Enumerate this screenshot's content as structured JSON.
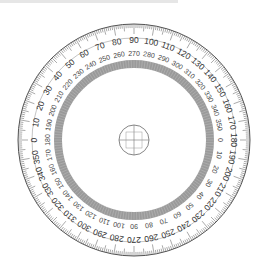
{
  "image": {
    "subject": "360-degree circular protractor",
    "colors": {
      "background": "#ffffff",
      "line": "#555555",
      "inner_band": "#9a9a9a",
      "text": "#333333",
      "top_bar": "#e6e6e6"
    }
  },
  "protractor": {
    "center": [
      134,
      140
    ],
    "outer_radius": 116,
    "outer_scale": {
      "description": "0 at left, increasing clockwise, 90 at top, 180 at right, 270 at bottom",
      "labels": [
        "0",
        "10",
        "20",
        "30",
        "40",
        "50",
        "60",
        "70",
        "80",
        "90",
        "100",
        "110",
        "120",
        "130",
        "140",
        "150",
        "160",
        "170",
        "180",
        "190",
        "200",
        "210",
        "220",
        "230",
        "240",
        "250",
        "260",
        "270",
        "280",
        "290",
        "300",
        "310",
        "320",
        "330",
        "340",
        "350"
      ]
    },
    "inner_scale": {
      "description": "180 at left, 270 at top, 0 at right, 90 at bottom",
      "labels": [
        "180",
        "190",
        "200",
        "210",
        "220",
        "230",
        "240",
        "250",
        "260",
        "270",
        "280",
        "290",
        "300",
        "310",
        "320",
        "330",
        "340",
        "350",
        "0",
        "10",
        "20",
        "30",
        "40",
        "50",
        "60",
        "70",
        "80",
        "90",
        "100",
        "110",
        "120",
        "130",
        "140",
        "150",
        "160",
        "170"
      ]
    },
    "spoke_count": 36,
    "center_marker": "crosshair circle"
  }
}
